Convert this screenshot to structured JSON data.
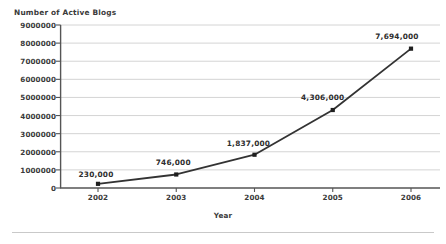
{
  "chart_data": {
    "type": "line",
    "title": "",
    "xlabel": "Year",
    "ylabel": "Number of Active Blogs",
    "categories": [
      "2002",
      "2003",
      "2004",
      "2005",
      "2006"
    ],
    "values": [
      230000,
      746000,
      1837000,
      4306000,
      7694000
    ],
    "point_labels": [
      "230,000",
      "746,000",
      "1,837,000",
      "4,306,000",
      "7,694,000"
    ],
    "ylim": [
      0,
      9000000
    ],
    "ytick_labels": [
      "9000000",
      "8000000",
      "7000000",
      "6000000",
      "5000000",
      "4000000",
      "3000000",
      "2000000",
      "1000000",
      "0"
    ],
    "ytick_values": [
      9000000,
      8000000,
      7000000,
      6000000,
      5000000,
      4000000,
      3000000,
      2000000,
      1000000,
      0
    ],
    "grid": true,
    "legend": false,
    "series": [
      {
        "name": "Number of Active Blogs",
        "values": [
          230000,
          746000,
          1837000,
          4306000,
          7694000
        ]
      }
    ],
    "colors": {
      "line": "#333333",
      "marker": "#1f1f1f",
      "grid": "#cfcfcf",
      "axis": "#555555",
      "text": "#3a3a3a",
      "background": "#ffffff",
      "rule": "#c9c9c9"
    }
  }
}
